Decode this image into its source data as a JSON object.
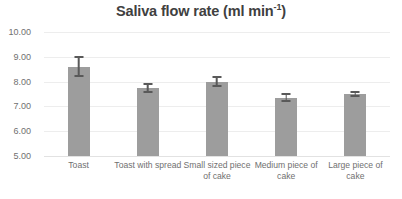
{
  "chart_data": {
    "type": "bar",
    "title": "Saliva flow rate (ml min-1)",
    "title_main": "Saliva flow rate (ml min",
    "title_sup": "-1",
    "title_tail": ")",
    "xlabel": "",
    "ylabel": "",
    "categories": [
      "Toast",
      "Toast with spread",
      "Small sized piece of cake",
      "Medium piece of cake",
      "Large piece of cake"
    ],
    "values": [
      8.6,
      7.75,
      8.0,
      7.35,
      7.5
    ],
    "errors": [
      0.42,
      0.2,
      0.22,
      0.18,
      0.12
    ],
    "ylim": [
      5.0,
      10.0
    ],
    "ytick_values": [
      10.0,
      9.0,
      8.0,
      7.0,
      6.0,
      5.0
    ],
    "ytick_labels": [
      "10.00",
      "9.00",
      "8.00",
      "7.00",
      "6.00",
      "5.00"
    ],
    "grid": true,
    "legend": false,
    "bar_color": "#9d9d9d",
    "error_color": "#595959",
    "gridline_color": "#ededed",
    "title_color": "#404040",
    "tick_color": "#707070",
    "background": "#ffffff"
  }
}
